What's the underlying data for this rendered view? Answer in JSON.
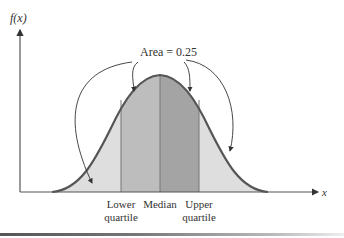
{
  "diagram": {
    "y_axis_label": "f(x)",
    "x_axis_label": "x",
    "annotation": "Area = 0.25",
    "regions": [
      {
        "name": "lower-tail",
        "color": "#dedede"
      },
      {
        "name": "lower-middle",
        "color": "#bdbdbd"
      },
      {
        "name": "upper-middle",
        "color": "#a4a4a4"
      },
      {
        "name": "upper-tail",
        "color": "#dedede"
      }
    ],
    "markers": [
      {
        "line1": "Lower",
        "line2": "quartile"
      },
      {
        "line1": "Median",
        "line2": ""
      },
      {
        "line1": "Upper",
        "line2": "quartile"
      }
    ],
    "curve_color": "#555555"
  }
}
